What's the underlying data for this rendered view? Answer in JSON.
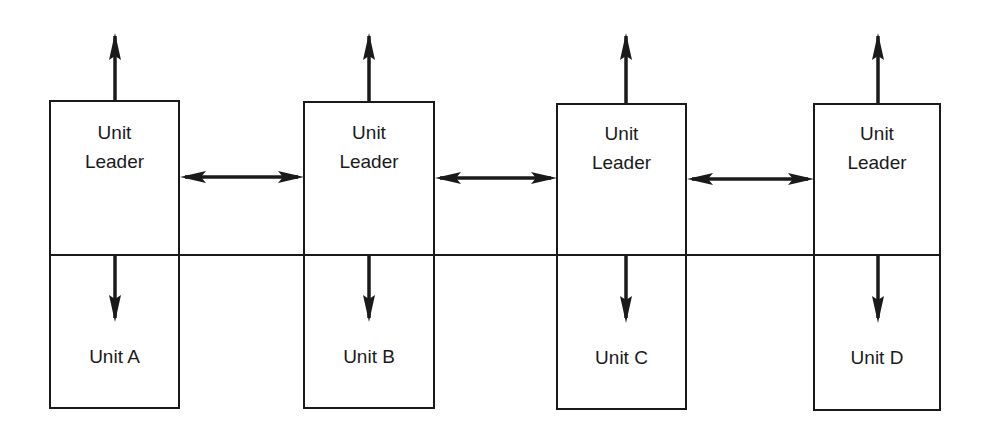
{
  "diagram": {
    "type": "organization-structure",
    "line_color": "#1a1a1a",
    "background": "#ffffff",
    "units": [
      {
        "leader_line1": "Unit",
        "leader_line2": "Leader",
        "unit_label": "Unit A"
      },
      {
        "leader_line1": "Unit",
        "leader_line2": "Leader",
        "unit_label": "Unit B"
      },
      {
        "leader_line1": "Unit",
        "leader_line2": "Leader",
        "unit_label": "Unit C"
      },
      {
        "leader_line1": "Unit",
        "leader_line2": "Leader",
        "unit_label": "Unit D"
      }
    ],
    "connections": [
      {
        "from": "Unit A Leader",
        "to": "Unit B Leader",
        "type": "bidirectional"
      },
      {
        "from": "Unit B Leader",
        "to": "Unit C Leader",
        "type": "bidirectional"
      },
      {
        "from": "Unit C Leader",
        "to": "Unit D Leader",
        "type": "bidirectional"
      }
    ]
  }
}
